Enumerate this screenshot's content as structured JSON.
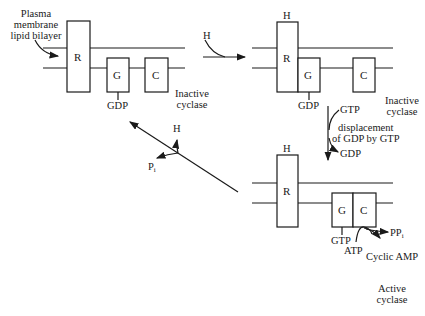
{
  "diagram": {
    "colors": {
      "stroke": "#1a1a1a",
      "background": "#ffffff"
    },
    "panels": [
      {
        "id": "inactive-1",
        "state_label": [
          "Inactive",
          "cyclase"
        ],
        "membrane_label": [
          "Plasma",
          "membrane",
          "lipid bilayer"
        ],
        "components": {
          "receptor": "R",
          "g_protein": "G",
          "cyclase": "C"
        },
        "g_bound": "GDP"
      },
      {
        "id": "inactive-2",
        "state_label": [
          "Inactive",
          "cyclase"
        ],
        "hormone": "H",
        "components": {
          "receptor": "R",
          "g_protein": "G",
          "cyclase": "C"
        },
        "g_bound": "GDP"
      },
      {
        "id": "active",
        "state_label": [
          "Active",
          "cyclase"
        ],
        "hormone": "H",
        "components": {
          "receptor": "R",
          "g_protein": "G",
          "cyclase": "C"
        },
        "g_bound": "GTP",
        "substrate": "ATP",
        "products": {
          "pp": "PP",
          "pp_sub": "i",
          "camp": "Cyclic AMP"
        }
      }
    ],
    "transitions": {
      "hormone_binding": {
        "label": "H"
      },
      "exchange": {
        "in": "GTP",
        "out": "GDP",
        "label": [
          "displacement",
          "of GDP by GTP"
        ]
      },
      "hydrolysis": {
        "released_hormone": "H",
        "released_p": "P",
        "released_p_sub": "i"
      }
    }
  }
}
